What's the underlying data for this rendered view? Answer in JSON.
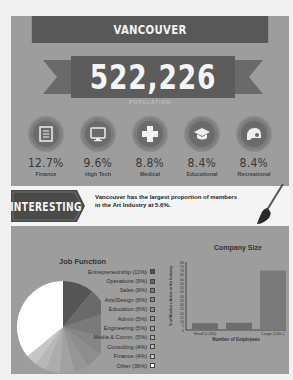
{
  "header": {
    "city": "VANCOUVER",
    "population": "522,226",
    "population_caption": "POPULATION"
  },
  "industries": [
    {
      "icon": "finance-document-icon",
      "percent": "12.7%",
      "label": "Finance"
    },
    {
      "icon": "monitor-icon",
      "percent": "9.6%",
      "label": "High Tech"
    },
    {
      "icon": "medical-cross-icon",
      "percent": "8.8%",
      "label": "Medical"
    },
    {
      "icon": "graduation-cap-icon",
      "percent": "8.4%",
      "label": "Educational"
    },
    {
      "icon": "helmet-icon",
      "percent": "8.4%",
      "label": "Recreational"
    }
  ],
  "interesting": {
    "tag": "INTERESTING",
    "fact_line1": "Vancouver has the largest proportion of members",
    "fact_line2": "in the Art Industry at 5.6%."
  },
  "colors": {
    "background": "#9d9d9d",
    "dark": "#585858",
    "band": "#f5f5f5"
  },
  "chart_data": [
    {
      "type": "pie",
      "title": "Job Function",
      "legend_position": "right",
      "categories": [
        "Entrepreneurship",
        "Operations",
        "Sales",
        "Arts/Design",
        "Education",
        "Admin",
        "Engineering",
        "Media & Comm.",
        "Consulting",
        "Finance",
        "Other"
      ],
      "values": [
        11,
        9,
        9,
        6,
        6,
        5,
        5,
        5,
        4,
        4,
        36
      ],
      "legend_labels": [
        "Entrepreneurship (11%)",
        "Operations (9%)",
        "Sales (9%)",
        "Arts/Design (6%)",
        "Education (6%)",
        "Admin (5%)",
        "Engineering (5%)",
        "Media & Comm. (5%)",
        "Consulting (4%)",
        "Finance (4%)",
        "Other (36%)"
      ],
      "colors": [
        "#555555",
        "#6a6a6a",
        "#7a7a7a",
        "#858585",
        "#8e8e8e",
        "#969696",
        "#a2a2a2",
        "#adadad",
        "#b8b8b8",
        "#c6c6c6",
        "#ffffff"
      ]
    },
    {
      "type": "bar",
      "title": "Company Size",
      "categories": [
        "Small (<200)",
        "",
        "Large (500+)"
      ],
      "values": [
        8,
        8.5,
        70
      ],
      "xlabel": "Number of Employees",
      "ylabel": "% of Members Active in the Industry",
      "ylim": [
        0,
        80
      ],
      "yticks": [
        0,
        5,
        10,
        15,
        20,
        25,
        30,
        35,
        40,
        45,
        50,
        55,
        60,
        65,
        70,
        75,
        80
      ],
      "grid": false
    }
  ]
}
